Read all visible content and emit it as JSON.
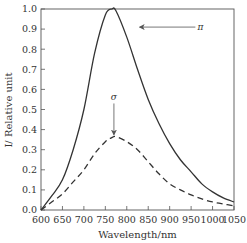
{
  "chart_data": {
    "type": "line",
    "title": "",
    "xlabel": "Wavelength/nm",
    "ylabel": "I/ Relative unit",
    "xlim": [
      600,
      1050
    ],
    "ylim": [
      0.0,
      1.0
    ],
    "x_ticks": [
      "600",
      "650",
      "700",
      "750",
      "800",
      "850",
      "900",
      "950",
      "1000",
      "1050"
    ],
    "y_ticks": [
      "0.0",
      "0.1",
      "0.2",
      "0.3",
      "0.4",
      "0.5",
      "0.6",
      "0.7",
      "0.8",
      "0.9",
      "1.0"
    ],
    "grid": false,
    "legend": null,
    "x": [
      600,
      625,
      650,
      675,
      700,
      725,
      750,
      765,
      775,
      800,
      825,
      850,
      875,
      900,
      925,
      950,
      975,
      1000,
      1025,
      1050
    ],
    "series": [
      {
        "name": "π",
        "style": "solid",
        "color": "#333333",
        "values": [
          0.0,
          0.07,
          0.15,
          0.3,
          0.5,
          0.78,
          0.97,
          1.0,
          0.99,
          0.86,
          0.7,
          0.55,
          0.43,
          0.33,
          0.25,
          0.19,
          0.13,
          0.09,
          0.06,
          0.04
        ]
      },
      {
        "name": "σ",
        "style": "dashed",
        "color": "#333333",
        "values": [
          0.0,
          0.04,
          0.08,
          0.14,
          0.2,
          0.28,
          0.34,
          0.36,
          0.365,
          0.34,
          0.3,
          0.24,
          0.18,
          0.13,
          0.1,
          0.075,
          0.055,
          0.04,
          0.03,
          0.02
        ]
      }
    ],
    "annotations": [
      {
        "text": "π",
        "arrow_from": [
          960,
          0.91
        ],
        "arrow_to": [
          830,
          0.91
        ]
      },
      {
        "text": "σ",
        "arrow_from": [
          770,
          0.53
        ],
        "arrow_to": [
          770,
          0.375
        ]
      }
    ]
  }
}
